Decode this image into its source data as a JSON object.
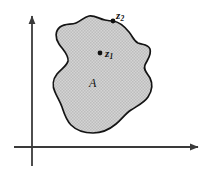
{
  "figure": {
    "caption_labels": {
      "set_label": "A",
      "interior_point_label": "z",
      "interior_point_subscript": "1",
      "boundary_point_label": "z",
      "boundary_point_subscript": "2"
    },
    "colors": {
      "region_fill": "#c9c9c9",
      "region_stroke": "#141414",
      "axis": "#3a3a3a",
      "point": "#111111",
      "background": "#ffffff"
    },
    "axes": {
      "x_axis": {
        "name": "horizontal-axis",
        "y": 147,
        "x_start": 14,
        "x_end": 202,
        "arrow": "right"
      },
      "y_axis": {
        "name": "vertical-axis",
        "x": 32,
        "y_start": 166,
        "y_end": 12,
        "arrow": "up"
      }
    },
    "points": [
      {
        "name": "interior-point-z1",
        "x": 100,
        "y": 53,
        "radius": 2.4,
        "kind": "interior"
      },
      {
        "name": "boundary-point-z2",
        "x": 113,
        "y": 21,
        "radius": 2.4,
        "kind": "boundary"
      }
    ],
    "region": {
      "name": "region-A",
      "description": "shaded irregular closed region"
    }
  }
}
